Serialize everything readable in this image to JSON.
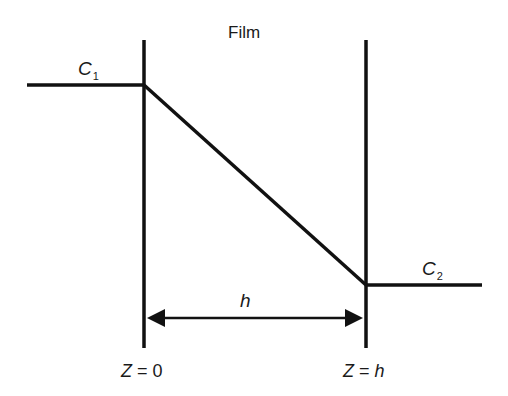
{
  "diagram": {
    "title": "Film",
    "concentration_left": {
      "symbol": "C",
      "subscript": "1"
    },
    "concentration_right": {
      "symbol": "C",
      "subscript": "2"
    },
    "thickness_label": "h",
    "boundary_left": "Z = 0",
    "boundary_right": "Z = h",
    "colors": {
      "line": "#111111",
      "text": "#1a1a1a",
      "background": "#ffffff"
    }
  }
}
